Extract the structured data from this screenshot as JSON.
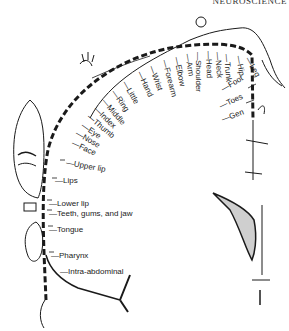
{
  "header": {
    "running_title": "NEUROSCIENCE"
  },
  "figure": {
    "labels": [
      {
        "text": "Leg",
        "x": 247,
        "y": 54,
        "rot": 60
      },
      {
        "text": "Hip",
        "x": 238,
        "y": 52,
        "rot": 80
      },
      {
        "text": "Trunk",
        "x": 226,
        "y": 50,
        "rot": 85
      },
      {
        "text": "Neck",
        "x": 217,
        "y": 48,
        "rot": 85
      },
      {
        "text": "Head",
        "x": 208,
        "y": 47,
        "rot": 88
      },
      {
        "text": "Shoulder",
        "x": 198,
        "y": 48,
        "rot": 90
      },
      {
        "text": "Arm",
        "x": 187,
        "y": 50,
        "rot": 80
      },
      {
        "text": "Elbow",
        "x": 176,
        "y": 53,
        "rot": 78
      },
      {
        "text": "Forearm",
        "x": 164,
        "y": 56,
        "rot": 75
      },
      {
        "text": "Wrist",
        "x": 151,
        "y": 62,
        "rot": 70
      },
      {
        "text": "Hand",
        "x": 139,
        "y": 68,
        "rot": 65
      },
      {
        "text": "Little",
        "x": 124,
        "y": 78,
        "rot": 60
      },
      {
        "text": "Ring",
        "x": 113,
        "y": 87,
        "rot": 55
      },
      {
        "text": "Middle",
        "x": 103,
        "y": 96,
        "rot": 50
      },
      {
        "text": "Index",
        "x": 95,
        "y": 104,
        "rot": 45
      },
      {
        "text": "Thumb",
        "x": 88,
        "y": 112,
        "rot": 40
      },
      {
        "text": "Eye",
        "x": 82,
        "y": 121,
        "rot": 35
      },
      {
        "text": "Nose",
        "x": 76,
        "y": 129,
        "rot": 30
      },
      {
        "text": "Face",
        "x": 72,
        "y": 139,
        "rot": 25
      },
      {
        "text": "Upper lip",
        "x": 66,
        "y": 159,
        "rot": 10
      },
      {
        "text": "Lips",
        "x": 55,
        "y": 177,
        "rot": 0
      },
      {
        "text": "Lower lip",
        "x": 49,
        "y": 200,
        "rot": 0
      },
      {
        "text": "Teeth, gums, and jaw",
        "x": 49,
        "y": 210,
        "rot": 0
      },
      {
        "text": "Tongue",
        "x": 49,
        "y": 226,
        "rot": 0
      },
      {
        "text": "Pharynx",
        "x": 51,
        "y": 252,
        "rot": 0
      },
      {
        "text": "Intra-abdominal",
        "x": 60,
        "y": 268,
        "rot": 0
      },
      {
        "text": "Foot",
        "x": 222,
        "y": 86,
        "rot": -30
      },
      {
        "text": "Toes",
        "x": 220,
        "y": 103,
        "rot": -25
      },
      {
        "text": "Gen",
        "x": 222,
        "y": 116,
        "rot": -20
      }
    ]
  },
  "colors": {
    "ink": "#1a1a1a",
    "background": "#ffffff"
  }
}
